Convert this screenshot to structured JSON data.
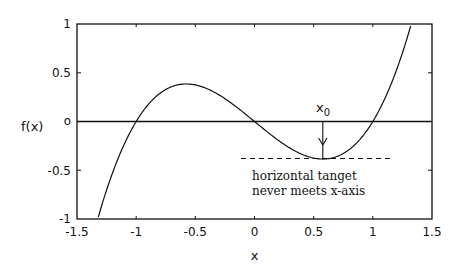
{
  "chart_data": {
    "type": "line",
    "title": "",
    "xlabel": "x",
    "ylabel": "f(x)",
    "xlim": [
      -1.5,
      1.5
    ],
    "ylim": [
      -1,
      1
    ],
    "grid": false,
    "legend": null,
    "function": "f(x) = x^3 - x",
    "x_ticks": [
      -1.5,
      -1,
      -0.5,
      0,
      0.5,
      1,
      1.5
    ],
    "x_tick_labels": [
      "-1.5",
      "-1",
      "-0.5",
      "0",
      "0.5",
      "1",
      "1.5"
    ],
    "y_ticks": [
      -1,
      -0.5,
      0,
      0.5,
      1
    ],
    "y_tick_labels": [
      "-1",
      "-0.5",
      "o",
      "0.5",
      "1"
    ],
    "series": [
      {
        "name": "f(x)",
        "x": [
          -1.32,
          -1.2,
          -1.1,
          -1.0,
          -0.9,
          -0.8,
          -0.7,
          -0.6,
          -0.577,
          -0.5,
          -0.4,
          -0.3,
          -0.2,
          -0.1,
          0.0,
          0.1,
          0.2,
          0.3,
          0.4,
          0.5,
          0.577,
          0.6,
          0.7,
          0.8,
          0.9,
          1.0,
          1.1,
          1.2,
          1.32
        ],
        "values": [
          -0.98,
          -0.528,
          -0.231,
          0.0,
          0.171,
          0.288,
          0.357,
          0.384,
          0.385,
          0.375,
          0.336,
          0.273,
          0.192,
          0.099,
          0.0,
          -0.099,
          -0.192,
          -0.273,
          -0.336,
          -0.375,
          -0.385,
          -0.384,
          -0.357,
          -0.288,
          -0.171,
          0.0,
          0.231,
          0.528,
          0.98
        ]
      }
    ],
    "reference_lines": [
      {
        "type": "horizontal",
        "y": 0,
        "style": "solid",
        "x_range": [
          -1.5,
          1.5
        ]
      },
      {
        "type": "horizontal",
        "y": -0.385,
        "style": "dashed",
        "x_range": [
          -0.12,
          1.18
        ],
        "label": "horizontal tangent at local minimum"
      }
    ],
    "annotations": [
      {
        "text": "x0",
        "display": "x₀",
        "x": 0.577,
        "y": 0.2,
        "arrow_to": [
          0.577,
          -0.385
        ]
      },
      {
        "text": "horizontal tanget",
        "x": -0.05,
        "y": -0.53
      },
      {
        "text": "never meets x-axis",
        "x": -0.05,
        "y": -0.68
      }
    ]
  },
  "labels": {
    "xlabel": "x",
    "ylabel": "f(x)",
    "x0_base": "x",
    "x0_sub": "0",
    "note_line1": "horizontal tanget",
    "note_line2": "never meets x-axis",
    "xticks": [
      "-1.5",
      "-1",
      "-0.5",
      "0",
      "0.5",
      "1",
      "1.5"
    ],
    "yticks": [
      "1",
      "0.5",
      "o",
      "-0.5",
      "-1"
    ]
  }
}
